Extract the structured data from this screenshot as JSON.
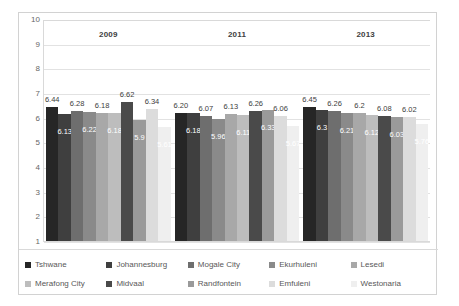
{
  "chart_data": {
    "type": "bar",
    "title": "",
    "subtitle": "",
    "xlabel": "",
    "ylabel": "",
    "ylim": [
      1,
      10
    ],
    "ytick_labels": [
      "10",
      "9",
      "8",
      "7",
      "6",
      "5",
      "4",
      "3",
      "2",
      "1"
    ],
    "grid": true,
    "legend_position": "bottom",
    "categories": [
      "2009",
      "2011",
      "2013"
    ],
    "series": [
      {
        "name": "Tshwane",
        "color": "#262626",
        "values": [
          6.44,
          6.2,
          6.45
        ],
        "labels": [
          "6.44",
          "6.20",
          "6.45"
        ]
      },
      {
        "name": "Johannesburg",
        "color": "#3f3f3f",
        "values": [
          6.13,
          6.18,
          6.3
        ],
        "labels": [
          "6.13",
          "6.18",
          "6.3"
        ]
      },
      {
        "name": "Mogale City",
        "color": "#6e6e6e",
        "values": [
          6.28,
          6.07,
          6.26
        ],
        "labels": [
          "6.28",
          "6.07",
          "6.26"
        ]
      },
      {
        "name": "Ekurhuleni",
        "color": "#8a8a8a",
        "values": [
          6.22,
          5.96,
          6.21
        ],
        "labels": [
          "6.22",
          "5.96",
          "6.21"
        ]
      },
      {
        "name": "Lesedi",
        "color": "#a8a8a8",
        "values": [
          6.18,
          6.13,
          6.2
        ],
        "labels": [
          "6.18",
          "6.13",
          "6.2"
        ]
      },
      {
        "name": "Merafong City",
        "color": "#bdbdbd",
        "values": [
          6.18,
          6.11,
          6.12
        ],
        "labels": [
          "6.18",
          "6.11",
          "6.12"
        ]
      },
      {
        "name": "Midvaal",
        "color": "#4a4a4a",
        "values": [
          6.62,
          6.26,
          6.08
        ],
        "labels": [
          "6.62",
          "6.26",
          "6.08"
        ]
      },
      {
        "name": "Randfontein",
        "color": "#9a9a9a",
        "values": [
          5.9,
          6.33,
          6.03
        ],
        "labels": [
          "5.9",
          "6.33",
          "6.03"
        ]
      },
      {
        "name": "Emfuleni",
        "color": "#dcdcdc",
        "values": [
          6.34,
          6.06,
          6.02
        ],
        "labels": [
          "6.34",
          "6.06",
          "6.02"
        ]
      },
      {
        "name": "Westonaria",
        "color": "#efefef",
        "values": [
          5.61,
          5.67,
          5.76
        ],
        "labels": [
          "5.61",
          "5.67",
          "5.76"
        ]
      }
    ]
  },
  "legend": {
    "rows": [
      [
        "Tshwane",
        "Johannesburg",
        "Mogale City",
        "Ekurhuleni",
        "Lesedi"
      ],
      [
        "Merafong City",
        "Midvaal",
        "Randfontein",
        "Emfuleni",
        "Westonaria"
      ]
    ]
  },
  "colors": {
    "frame_border": "#d2d2d2",
    "grid": "#e2e2e2",
    "axis": "#d9d9d9",
    "tick_text": "#666666",
    "label_text": "#3d3d3d",
    "legend_text": "#585858"
  }
}
